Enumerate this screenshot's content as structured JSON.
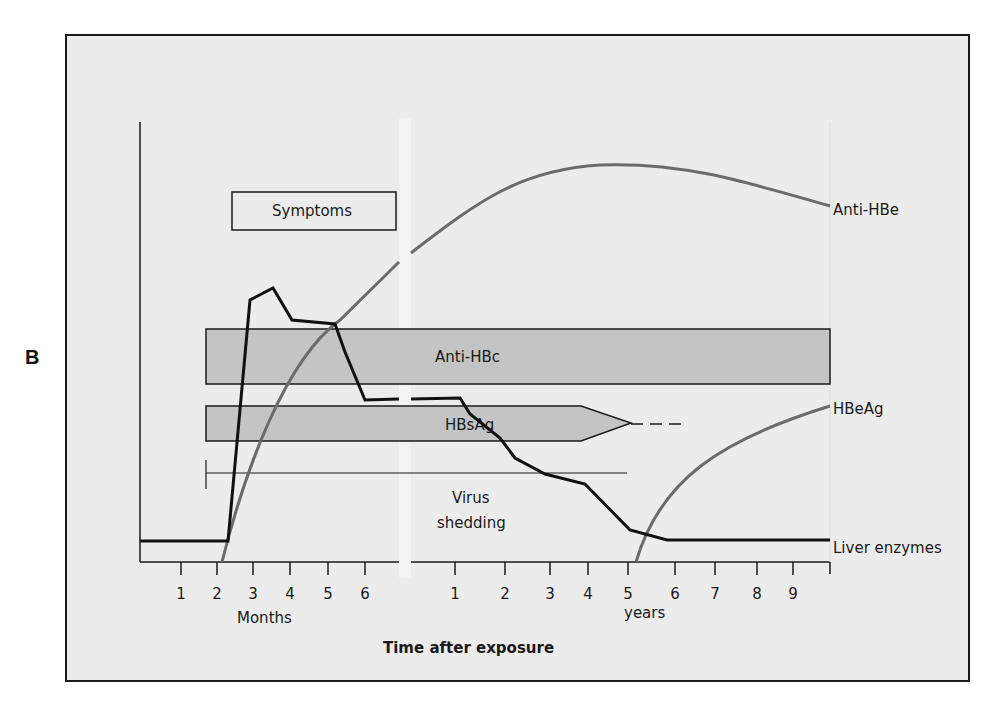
{
  "panel_label": "B",
  "labels": {
    "symptoms": "Symptoms",
    "anti_hbe": "Anti-HBe",
    "anti_hbc": "Anti-HBc",
    "hbsag": "HBsAg",
    "hbeag": "HBeAg",
    "virus_shedding_1": "Virus",
    "virus_shedding_2": "shedding",
    "liver_enzymes": "Liver enzymes",
    "months": "Months",
    "years": "years",
    "x_title": "Time after exposure"
  },
  "colors": {
    "background": "#ececec",
    "frame": "#1a1a1a",
    "bar_fill": "#c4c4c4",
    "antibody_curve": "#6b6b6b",
    "liver_curve": "#111111"
  },
  "chart_data": {
    "type": "line",
    "xlabel": "Time after exposure",
    "ylabel": "",
    "x_axis_segments": [
      {
        "unit": "Months",
        "ticks": [
          "1",
          "2",
          "3",
          "4",
          "5",
          "6"
        ]
      },
      {
        "unit": "years",
        "ticks": [
          "1",
          "2",
          "3",
          "4",
          "5",
          "6",
          "7",
          "8",
          "9"
        ]
      }
    ],
    "axis_break": "between 6 months and 1 year",
    "series": [
      {
        "name": "Anti-HBe",
        "style": "gray curve",
        "description": "rises from ~2.2 months, peaks around 4-5 years, declines slightly to 10 years"
      },
      {
        "name": "HBeAg",
        "style": "gray curve",
        "description": "rises from ~5.2 years to 10 years"
      },
      {
        "name": "Liver enzymes",
        "style": "black line",
        "description": "baseline until ~2.3 months, peak at ~3 months, plateau to ~5.3 months, drop to intermediate until ~1.5 years, declines to baseline by ~6 years"
      }
    ],
    "bars": [
      {
        "name": "Symptoms",
        "start": "2.3 months",
        "end": "~7 months"
      },
      {
        "name": "Anti-HBc",
        "start": "1.7 months",
        "end": "10 years"
      },
      {
        "name": "HBsAg",
        "start": "1.7 months",
        "end": "~5 years (tapering, dashed to ~6.5 years)"
      },
      {
        "name": "Virus shedding",
        "start": "1.7 months",
        "end": "~5 years"
      }
    ]
  },
  "geometry": {
    "frame": {
      "x": 66,
      "y": 35,
      "w": 903,
      "h": 646
    },
    "yaxis_x": 140,
    "yaxis_top": 122,
    "xaxis_y": 562,
    "break_x1": 399,
    "break_x2": 411,
    "right_end_x": 830,
    "month_ticks_x": [
      181,
      217,
      253,
      290,
      328,
      365
    ],
    "month_ticks_lbl_y": 599,
    "year_ticks_x": [
      455,
      505,
      550,
      588,
      628,
      675,
      715,
      757,
      793
    ],
    "anti_hbe_path": "M222,562 C245,470 285,360 340,320 L399,262 M411,253 C480,200 520,170 600,165 C680,162 740,180 830,206",
    "hbeag_path": "M636,562 C660,480 720,440 830,406",
    "liver_path": "M140,541 L228,541 L250,300 L273,288 L292,320 L335,324 L345,352 L365,400 L399,399 M411,399 L460,398 L470,414 L500,438 L515,458 L545,474 L585,484 L630,530 L667,540 L830,540",
    "symptoms_box": {
      "x": 232,
      "y": 192,
      "w": 164,
      "h": 38
    },
    "anti_hbc_bar": {
      "x": 206,
      "y": 329,
      "w": 624,
      "h": 55
    },
    "hbsag_bar": "M206,406 L581,406 L631,423 L581,441 L206,441 Z",
    "hbsag_dash": "M631,424 L685,424",
    "shedding_line": {
      "x1": 206,
      "x2": 627,
      "y": 473,
      "cap_top": 460,
      "cap_bot": 489
    }
  }
}
